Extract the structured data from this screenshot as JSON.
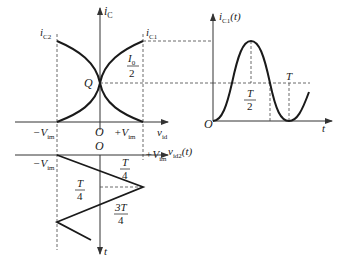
{
  "diagram": {
    "transfer": {
      "y_axis_label": "i",
      "y_axis_sub": "C",
      "ic2_label": "i",
      "ic2_sub": "C2",
      "ic1_label": "i",
      "ic1_sub": "C1",
      "q_label": "Q",
      "i0_num": "I",
      "i0_num_sub": "0",
      "i0_den": "2",
      "origin_label": "O",
      "neg_v_label": "−V",
      "neg_v_sub": "im",
      "pos_v_label": "+V",
      "pos_v_sub": "im",
      "x_axis_label": "v",
      "x_axis_sub": "id"
    },
    "input_wave": {
      "origin_label": "O",
      "neg_v_label": "−V",
      "neg_v_sub": "im",
      "pos_v_label": "+V",
      "pos_v_sub": "im",
      "signal_label": "v",
      "signal_sub": "id2",
      "signal_arg": "(t)",
      "t_axis_label": "t",
      "frac1_num": "T",
      "frac1_den": "4",
      "frac2_num": "T",
      "frac2_den": "4",
      "frac3_num": "3T",
      "frac3_den": "4"
    },
    "output_wave": {
      "y_axis_label": "i",
      "y_axis_sub": "C1",
      "y_axis_arg": "(t)",
      "origin_label": "O",
      "t_axis_label": "t",
      "half_num": "T",
      "half_den": "2",
      "period_label": "T"
    }
  }
}
